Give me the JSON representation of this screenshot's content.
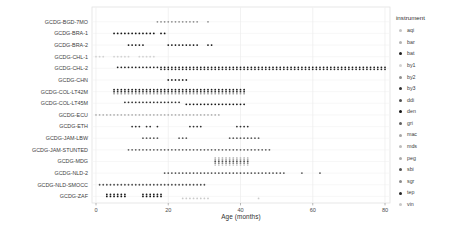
{
  "chart_data": {
    "type": "scatter",
    "title": "",
    "xlabel": "Age (months)",
    "ylabel": "",
    "xlim": [
      -1,
      82
    ],
    "x_ticks": [
      0,
      20,
      40,
      60,
      80
    ],
    "grid": "light vertical and horizontal gridlines, white panel, thin gray border",
    "legend": {
      "title": "instrument",
      "position": "right"
    },
    "instruments": [
      {
        "code": "aqi",
        "color": "#c4c4c4"
      },
      {
        "code": "bar",
        "color": "#b3b3b3"
      },
      {
        "code": "bat",
        "color": "#1f1f1f"
      },
      {
        "code": "by1",
        "color": "#d2d2d2"
      },
      {
        "code": "by2",
        "color": "#8f8f8f"
      },
      {
        "code": "by3",
        "color": "#303030"
      },
      {
        "code": "ddi",
        "color": "#4f4f4f"
      },
      {
        "code": "den",
        "color": "#141414"
      },
      {
        "code": "gri",
        "color": "#5f5f5f"
      },
      {
        "code": "mac",
        "color": "#a6a6a6"
      },
      {
        "code": "mds",
        "color": "#bdbdbd"
      },
      {
        "code": "peg",
        "color": "#ababab"
      },
      {
        "code": "sbi",
        "color": "#525252"
      },
      {
        "code": "sgr",
        "color": "#8c8c8c"
      },
      {
        "code": "tep",
        "color": "#262626"
      },
      {
        "code": "vin",
        "color": "#c9c9c9"
      }
    ],
    "rows": [
      {
        "label": "GCDG-BGD-7MO",
        "series": [
          {
            "instrument": "by2",
            "month_ranges": [
              [
                17,
                28
              ],
              [
                31,
                31
              ]
            ]
          }
        ]
      },
      {
        "label": "GCDG-BRA-1",
        "series": [
          {
            "instrument": "den",
            "month_ranges": [
              [
                5,
                16
              ],
              [
                18,
                19
              ]
            ]
          }
        ]
      },
      {
        "label": "GCDG-BRA-2",
        "series": [
          {
            "instrument": "den",
            "month_ranges": [
              [
                9,
                13
              ],
              [
                20,
                28
              ],
              [
                31,
                32
              ]
            ]
          }
        ]
      },
      {
        "label": "GCDG-CHL-1",
        "series": [
          {
            "instrument": "by1",
            "month_ranges": [
              [
                0,
                2
              ],
              [
                5,
                9
              ],
              [
                12,
                16
              ]
            ]
          }
        ]
      },
      {
        "label": "GCDG-CHL-2",
        "series": [
          {
            "instrument": "bat",
            "month_ranges": [
              [
                6,
                80
              ]
            ]
          },
          {
            "instrument": "tep",
            "month_ranges": [
              [
                18,
                80
              ]
            ]
          }
        ]
      },
      {
        "label": "GCDG-CHN",
        "series": [
          {
            "instrument": "by3",
            "month_ranges": [
              [
                20,
                25
              ]
            ]
          }
        ]
      },
      {
        "label": "GCDG-COL-LT42M",
        "series": [
          {
            "instrument": "bat",
            "month_ranges": [
              [
                5,
                41
              ]
            ]
          },
          {
            "instrument": "by3",
            "month_ranges": [
              [
                5,
                41
              ]
            ]
          },
          {
            "instrument": "mac",
            "month_ranges": [
              [
                5,
                41
              ]
            ]
          }
        ]
      },
      {
        "label": "GCDG-COL-LT45M",
        "series": [
          {
            "instrument": "by3",
            "month_ranges": [
              [
                8,
                23
              ]
            ]
          },
          {
            "instrument": "den",
            "month_ranges": [
              [
                25,
                41
              ]
            ]
          }
        ]
      },
      {
        "label": "GCDG-ECU",
        "series": [
          {
            "instrument": "bar",
            "month_ranges": [
              [
                0,
                34
              ]
            ]
          }
        ]
      },
      {
        "label": "GCDG-ETH",
        "series": [
          {
            "instrument": "by3",
            "month_ranges": [
              [
                10,
                12
              ],
              [
                14,
                15
              ],
              [
                17,
                17
              ],
              [
                26,
                29
              ],
              [
                39,
                42
              ]
            ]
          }
        ]
      },
      {
        "label": "GCDG-JAM-LBW",
        "series": [
          {
            "instrument": "gri",
            "month_ranges": [
              [
                13,
                17
              ],
              [
                23,
                25
              ],
              [
                37,
                45
              ]
            ]
          }
        ]
      },
      {
        "label": "GCDG-JAM-STUNTED",
        "series": [
          {
            "instrument": "gri",
            "month_ranges": [
              [
                9,
                48
              ]
            ]
          }
        ]
      },
      {
        "label": "GCDG-MDG",
        "series": [
          {
            "instrument": "mds",
            "month_ranges": [
              [
                33,
                42
              ]
            ]
          },
          {
            "instrument": "peg",
            "month_ranges": [
              [
                33,
                42
              ]
            ]
          },
          {
            "instrument": "sbi",
            "month_ranges": [
              [
                33,
                42
              ]
            ]
          },
          {
            "instrument": "sgr",
            "month_ranges": [
              [
                33,
                42
              ]
            ]
          },
          {
            "instrument": "vin",
            "month_ranges": [
              [
                33,
                42
              ]
            ]
          }
        ]
      },
      {
        "label": "GCDG-NLD-2",
        "series": [
          {
            "instrument": "ddi",
            "month_ranges": [
              [
                19,
                52
              ],
              [
                57,
                57
              ],
              [
                62,
                62
              ]
            ]
          }
        ]
      },
      {
        "label": "GCDG-NLD-SMOCC",
        "series": [
          {
            "instrument": "ddi",
            "month_ranges": [
              [
                1,
                30
              ]
            ]
          }
        ]
      },
      {
        "label": "GCDG-ZAF",
        "series": [
          {
            "instrument": "bat",
            "month_ranges": [
              [
                3,
                8
              ],
              [
                13,
                18
              ]
            ]
          },
          {
            "instrument": "den",
            "month_ranges": [
              [
                3,
                8
              ],
              [
                13,
                18
              ]
            ]
          },
          {
            "instrument": "vin",
            "month_ranges": [
              [
                24,
                31
              ],
              [
                45,
                45
              ]
            ]
          }
        ]
      }
    ]
  }
}
